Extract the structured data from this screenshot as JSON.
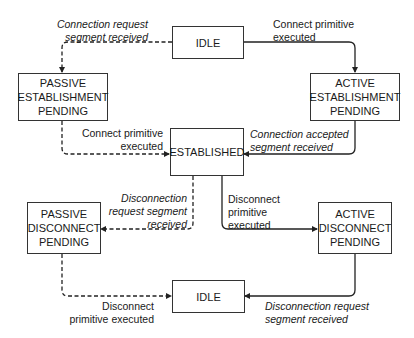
{
  "diagram": {
    "type": "state-machine",
    "states": [
      {
        "id": "idle_top",
        "lines": [
          "IDLE"
        ]
      },
      {
        "id": "passive_est",
        "lines": [
          "PASSIVE",
          "ESTABLISHMENT",
          "PENDING"
        ]
      },
      {
        "id": "active_est",
        "lines": [
          "ACTIVE",
          "ESTABLISHMENT",
          "PENDING"
        ]
      },
      {
        "id": "established",
        "lines": [
          "ESTABLISHED"
        ]
      },
      {
        "id": "passive_disc",
        "lines": [
          "PASSIVE",
          "DISCONNECT",
          "PENDING"
        ]
      },
      {
        "id": "active_disc",
        "lines": [
          "ACTIVE",
          "DISCONNECT",
          "PENDING"
        ]
      },
      {
        "id": "idle_bottom",
        "lines": [
          "IDLE"
        ]
      }
    ],
    "transitions": [
      {
        "from": "idle_top",
        "to": "passive_est",
        "style": "dashed",
        "lines": [
          "Connection request",
          "segment received"
        ],
        "italic": true
      },
      {
        "from": "idle_top",
        "to": "active_est",
        "style": "solid",
        "lines": [
          "Connect primitive",
          "executed"
        ],
        "italic": false
      },
      {
        "from": "passive_est",
        "to": "established",
        "style": "dashed",
        "lines": [
          "Connect primitive",
          "executed"
        ],
        "italic": false
      },
      {
        "from": "active_est",
        "to": "established",
        "style": "solid",
        "lines": [
          "Connection accepted",
          "segment received"
        ],
        "italic": true
      },
      {
        "from": "established",
        "to": "passive_disc",
        "style": "dashed",
        "lines": [
          "Disconnection",
          "request segment",
          "received"
        ],
        "italic": true
      },
      {
        "from": "established",
        "to": "active_disc",
        "style": "solid",
        "lines": [
          "Disconnect",
          "primitive",
          "executed"
        ],
        "italic": false
      },
      {
        "from": "passive_disc",
        "to": "idle_bottom",
        "style": "dashed",
        "lines": [
          "Disconnect",
          "primitive executed"
        ],
        "italic": false
      },
      {
        "from": "active_disc",
        "to": "idle_bottom",
        "style": "solid",
        "lines": [
          "Disconnection request",
          "segment received"
        ],
        "italic": true
      }
    ]
  }
}
